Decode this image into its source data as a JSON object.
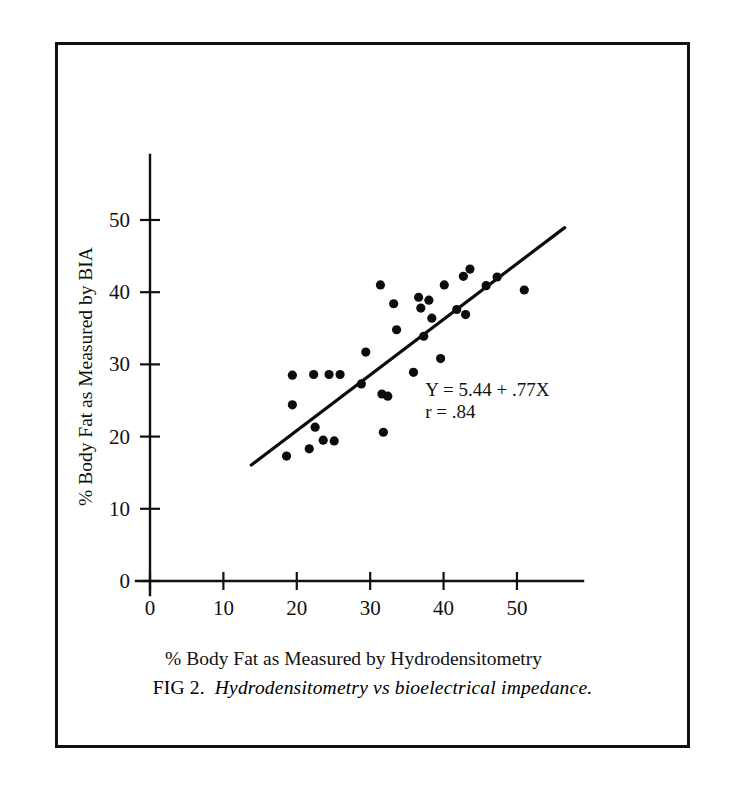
{
  "figure": {
    "caption_label": "FIG 2.",
    "caption_text": "Hydrodensitometry vs bioelectrical impedance."
  },
  "annotation": {
    "equation": "Y = 5.44 + .77X",
    "correlation": "r =  .84"
  },
  "chart_data": {
    "type": "scatter",
    "title": "",
    "xlabel": "% Body Fat as Measured by Hydrodensitometry",
    "ylabel": "% Body Fat as Measured by BIA",
    "xlim": [
      0,
      59
    ],
    "ylim": [
      0,
      59
    ],
    "xticks": [
      0,
      10,
      20,
      30,
      40,
      50
    ],
    "yticks": [
      0,
      10,
      20,
      30,
      40,
      50
    ],
    "xticklabels": [
      "0",
      "10",
      "20",
      "30",
      "40",
      "50"
    ],
    "yticklabels": [
      "0",
      "10",
      "20",
      "30",
      "40",
      "50"
    ],
    "grid": false,
    "legend": false,
    "marker": "filled-circle",
    "points": [
      {
        "x": 19.4,
        "y": 28.5
      },
      {
        "x": 19.4,
        "y": 24.4
      },
      {
        "x": 18.6,
        "y": 17.3
      },
      {
        "x": 22.3,
        "y": 28.6
      },
      {
        "x": 22.5,
        "y": 21.3
      },
      {
        "x": 21.7,
        "y": 18.3
      },
      {
        "x": 24.4,
        "y": 28.6
      },
      {
        "x": 23.6,
        "y": 19.5
      },
      {
        "x": 25.9,
        "y": 28.6
      },
      {
        "x": 25.1,
        "y": 19.4
      },
      {
        "x": 28.8,
        "y": 27.3
      },
      {
        "x": 29.4,
        "y": 31.7
      },
      {
        "x": 31.4,
        "y": 41.0
      },
      {
        "x": 31.6,
        "y": 25.9
      },
      {
        "x": 32.4,
        "y": 25.6
      },
      {
        "x": 31.8,
        "y": 20.6
      },
      {
        "x": 33.2,
        "y": 38.4
      },
      {
        "x": 33.6,
        "y": 34.8
      },
      {
        "x": 35.9,
        "y": 28.9
      },
      {
        "x": 36.6,
        "y": 39.3
      },
      {
        "x": 36.9,
        "y": 37.8
      },
      {
        "x": 37.3,
        "y": 33.9
      },
      {
        "x": 38.0,
        "y": 38.9
      },
      {
        "x": 38.4,
        "y": 36.4
      },
      {
        "x": 39.6,
        "y": 30.8
      },
      {
        "x": 40.1,
        "y": 41.0
      },
      {
        "x": 41.8,
        "y": 37.6
      },
      {
        "x": 42.7,
        "y": 42.2
      },
      {
        "x": 43.6,
        "y": 43.2
      },
      {
        "x": 43.0,
        "y": 36.9
      },
      {
        "x": 45.8,
        "y": 40.9
      },
      {
        "x": 47.3,
        "y": 42.1
      },
      {
        "x": 51.0,
        "y": 40.3
      }
    ],
    "regression": {
      "intercept": 5.44,
      "slope": 0.77,
      "r": 0.84,
      "x_start": 13.8,
      "x_end": 56.5
    }
  }
}
